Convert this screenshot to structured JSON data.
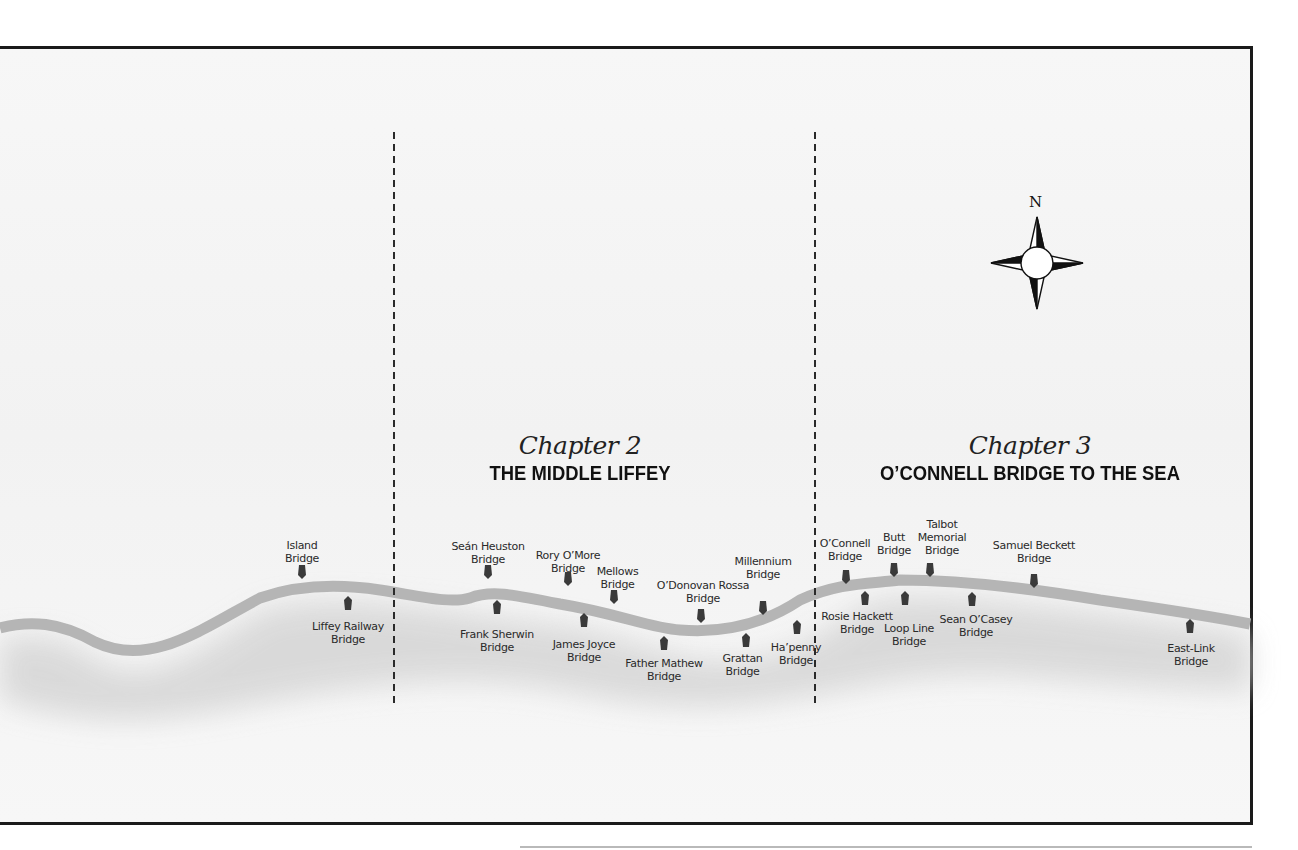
{
  "map": {
    "colors": {
      "river": "#b5b5b5",
      "shadow": "#cfcfcf",
      "marker": "#3a3a3a",
      "frame": "#1a1a1a",
      "divider": "#2a2a2a"
    },
    "compass": {
      "north_label": "N"
    },
    "chapters": [
      {
        "id": "chapter-2",
        "title": "Chapter 2",
        "subtitle": "THE MIDDLE LIFFEY"
      },
      {
        "id": "chapter-3",
        "title": "Chapter 3",
        "subtitle": "O’CONNELL BRIDGE TO THE SEA"
      }
    ],
    "bridges": [
      {
        "name_line1": "Island",
        "name_line2": "Bridge",
        "side": "north"
      },
      {
        "name_line1": "Liffey Railway",
        "name_line2": "Bridge",
        "side": "south"
      },
      {
        "name_line1": "Seán Heuston",
        "name_line2": "Bridge",
        "side": "north"
      },
      {
        "name_line1": "Frank Sherwin",
        "name_line2": "Bridge",
        "side": "south"
      },
      {
        "name_line1": "Rory O’More",
        "name_line2": "Bridge",
        "side": "north"
      },
      {
        "name_line1": "James Joyce",
        "name_line2": "Bridge",
        "side": "south"
      },
      {
        "name_line1": "Mellows",
        "name_line2": "Bridge",
        "side": "north"
      },
      {
        "name_line1": "Father Mathew",
        "name_line2": "Bridge",
        "side": "south"
      },
      {
        "name_line1": "O’Donovan Rossa",
        "name_line2": "Bridge",
        "side": "north"
      },
      {
        "name_line1": "Grattan",
        "name_line2": "Bridge",
        "side": "south"
      },
      {
        "name_line1": "Millennium",
        "name_line2": "Bridge",
        "side": "north"
      },
      {
        "name_line1": "Ha’penny",
        "name_line2": "Bridge",
        "side": "south"
      },
      {
        "name_line1": "O’Connell",
        "name_line2": "Bridge",
        "side": "north"
      },
      {
        "name_line1": "Rosie Hackett",
        "name_line2": "Bridge",
        "side": "south"
      },
      {
        "name_line1": "Butt",
        "name_line2": "Bridge",
        "side": "north"
      },
      {
        "name_line1": "Loop Line",
        "name_line2": "Bridge",
        "side": "south"
      },
      {
        "name_line1": "Talbot",
        "name_line2": "Memorial",
        "name_line3": "Bridge",
        "side": "north"
      },
      {
        "name_line1": "Sean O’Casey",
        "name_line2": "Bridge",
        "side": "south"
      },
      {
        "name_line1": "Samuel Beckett",
        "name_line2": "Bridge",
        "side": "north"
      },
      {
        "name_line1": "East-Link",
        "name_line2": "Bridge",
        "side": "south"
      }
    ]
  }
}
